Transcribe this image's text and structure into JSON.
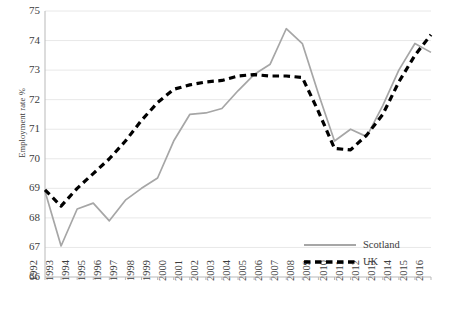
{
  "chart_data": {
    "type": "line",
    "title": "",
    "xlabel": "",
    "ylabel": "Employment rate %",
    "xlim": [
      1992,
      2016
    ],
    "ylim": [
      66,
      75
    ],
    "ytick_step": 1,
    "grid": true,
    "legend_position": "bottom-right",
    "x": [
      1992,
      1993,
      1994,
      1995,
      1996,
      1997,
      1998,
      1999,
      2000,
      2001,
      2002,
      2003,
      2004,
      2005,
      2006,
      2007,
      2008,
      2009,
      2010,
      2011,
      2012,
      2013,
      2014,
      2015,
      2016
    ],
    "categories": [
      "1992",
      "1993",
      "1994",
      "1995",
      "1996",
      "1997",
      "1998",
      "1999",
      "2000",
      "2001",
      "2002",
      "2003",
      "2004",
      "2005",
      "2006",
      "2007",
      "2008",
      "2009",
      "2010",
      "2011",
      "2012",
      "2013",
      "2014",
      "2015",
      "2016"
    ],
    "series": [
      {
        "name": "Scotland",
        "color": "#a6a6a6",
        "style": "solid",
        "values": [
          68.9,
          67.05,
          68.3,
          68.5,
          67.9,
          68.6,
          69.0,
          69.35,
          70.6,
          71.5,
          71.55,
          71.7,
          72.3,
          72.85,
          73.2,
          74.4,
          73.9,
          72.2,
          70.6,
          71.0,
          70.75,
          71.8,
          73.0,
          73.9,
          73.6
        ]
      },
      {
        "name": "UK",
        "color": "#000000",
        "style": "dashed",
        "values": [
          68.95,
          68.4,
          69.0,
          69.5,
          70.0,
          70.6,
          71.3,
          71.9,
          72.35,
          72.5,
          72.6,
          72.65,
          72.8,
          72.85,
          72.8,
          72.8,
          72.75,
          71.6,
          70.35,
          70.3,
          70.8,
          71.5,
          72.6,
          73.5,
          74.2
        ]
      }
    ]
  },
  "yticks": [
    "75",
    "74",
    "73",
    "72",
    "71",
    "70",
    "69",
    "68",
    "67",
    "66"
  ],
  "legend": {
    "items": [
      {
        "label": "Scotland",
        "swatch": "solid-line-swatch"
      },
      {
        "label": "UK",
        "swatch": "dashed-line-swatch"
      }
    ]
  }
}
